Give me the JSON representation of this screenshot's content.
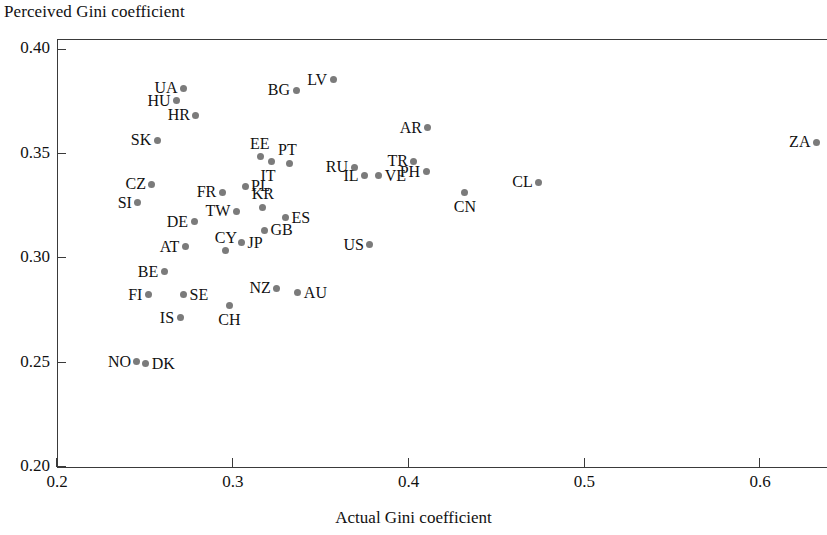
{
  "chart_data": {
    "type": "scatter",
    "title": "",
    "xlabel": "Actual Gini coefficient",
    "ylabel": "Perceived Gini coefficient",
    "xlim": [
      0.2,
      0.638
    ],
    "ylim": [
      0.2,
      0.405
    ],
    "xticks": [
      0.2,
      0.3,
      0.4,
      0.5,
      0.6
    ],
    "xtick_labels": [
      "0.2",
      "0.3",
      "0.4",
      "0.5",
      "0.6"
    ],
    "yticks": [
      0.2,
      0.25,
      0.3,
      0.35,
      0.4
    ],
    "ytick_labels": [
      "0.20",
      "0.25",
      "0.30",
      "0.35",
      "0.40"
    ],
    "grid": false,
    "legend": null,
    "marker_color": "#7b7b7b",
    "axis_color": "#3a3a3a",
    "points": [
      {
        "label": "UA",
        "x": 0.272,
        "y": 0.3815,
        "side": "left"
      },
      {
        "label": "HU",
        "x": 0.268,
        "y": 0.3755,
        "side": "left"
      },
      {
        "label": "HR",
        "x": 0.279,
        "y": 0.3685,
        "side": "left"
      },
      {
        "label": "SK",
        "x": 0.257,
        "y": 0.3565,
        "side": "left"
      },
      {
        "label": "BG",
        "x": 0.336,
        "y": 0.3805,
        "side": "left"
      },
      {
        "label": "LV",
        "x": 0.357,
        "y": 0.3855,
        "side": "left"
      },
      {
        "label": "AR",
        "x": 0.411,
        "y": 0.3625,
        "side": "left"
      },
      {
        "label": "ZA",
        "x": 0.632,
        "y": 0.3555,
        "side": "left"
      },
      {
        "label": "EE",
        "x": 0.316,
        "y": 0.3485,
        "side": "top"
      },
      {
        "label": "TR",
        "x": 0.403,
        "y": 0.3465,
        "side": "left"
      },
      {
        "label": "RU",
        "x": 0.369,
        "y": 0.3435,
        "side": "left"
      },
      {
        "label": "PT",
        "x": 0.332,
        "y": 0.3455,
        "side": "top"
      },
      {
        "label": "IT",
        "x": 0.322,
        "y": 0.3465,
        "side": "bottom"
      },
      {
        "label": "PH",
        "x": 0.41,
        "y": 0.3415,
        "side": "left"
      },
      {
        "label": "VE",
        "x": 0.383,
        "y": 0.3395,
        "side": "right"
      },
      {
        "label": "IL",
        "x": 0.375,
        "y": 0.3395,
        "side": "left"
      },
      {
        "label": "CN",
        "x": 0.432,
        "y": 0.3315,
        "side": "bottom"
      },
      {
        "label": "CL",
        "x": 0.474,
        "y": 0.3365,
        "side": "left"
      },
      {
        "label": "CZ",
        "x": 0.254,
        "y": 0.3355,
        "side": "left"
      },
      {
        "label": "SI",
        "x": 0.246,
        "y": 0.3265,
        "side": "left"
      },
      {
        "label": "PL",
        "x": 0.307,
        "y": 0.3345,
        "side": "right"
      },
      {
        "label": "FR",
        "x": 0.294,
        "y": 0.3315,
        "side": "left"
      },
      {
        "label": "KR",
        "x": 0.317,
        "y": 0.3245,
        "side": "top"
      },
      {
        "label": "TW",
        "x": 0.302,
        "y": 0.3225,
        "side": "left"
      },
      {
        "label": "ES",
        "x": 0.33,
        "y": 0.3195,
        "side": "right"
      },
      {
        "label": "DE",
        "x": 0.278,
        "y": 0.3175,
        "side": "left"
      },
      {
        "label": "GB",
        "x": 0.318,
        "y": 0.3135,
        "side": "right"
      },
      {
        "label": "AT",
        "x": 0.273,
        "y": 0.3055,
        "side": "left"
      },
      {
        "label": "JP",
        "x": 0.305,
        "y": 0.3075,
        "side": "right"
      },
      {
        "label": "CY",
        "x": 0.296,
        "y": 0.3035,
        "side": "top"
      },
      {
        "label": "US",
        "x": 0.378,
        "y": 0.3065,
        "side": "left"
      },
      {
        "label": "BE",
        "x": 0.261,
        "y": 0.2935,
        "side": "left"
      },
      {
        "label": "NZ",
        "x": 0.325,
        "y": 0.2855,
        "side": "left"
      },
      {
        "label": "AU",
        "x": 0.337,
        "y": 0.2835,
        "side": "right"
      },
      {
        "label": "SE",
        "x": 0.272,
        "y": 0.2825,
        "side": "right"
      },
      {
        "label": "FI",
        "x": 0.252,
        "y": 0.2825,
        "side": "left"
      },
      {
        "label": "IS",
        "x": 0.27,
        "y": 0.2715,
        "side": "left"
      },
      {
        "label": "CH",
        "x": 0.298,
        "y": 0.2775,
        "side": "bottom"
      },
      {
        "label": "NO",
        "x": 0.2455,
        "y": 0.2505,
        "side": "left"
      },
      {
        "label": "DK",
        "x": 0.2505,
        "y": 0.2495,
        "side": "right"
      }
    ]
  }
}
